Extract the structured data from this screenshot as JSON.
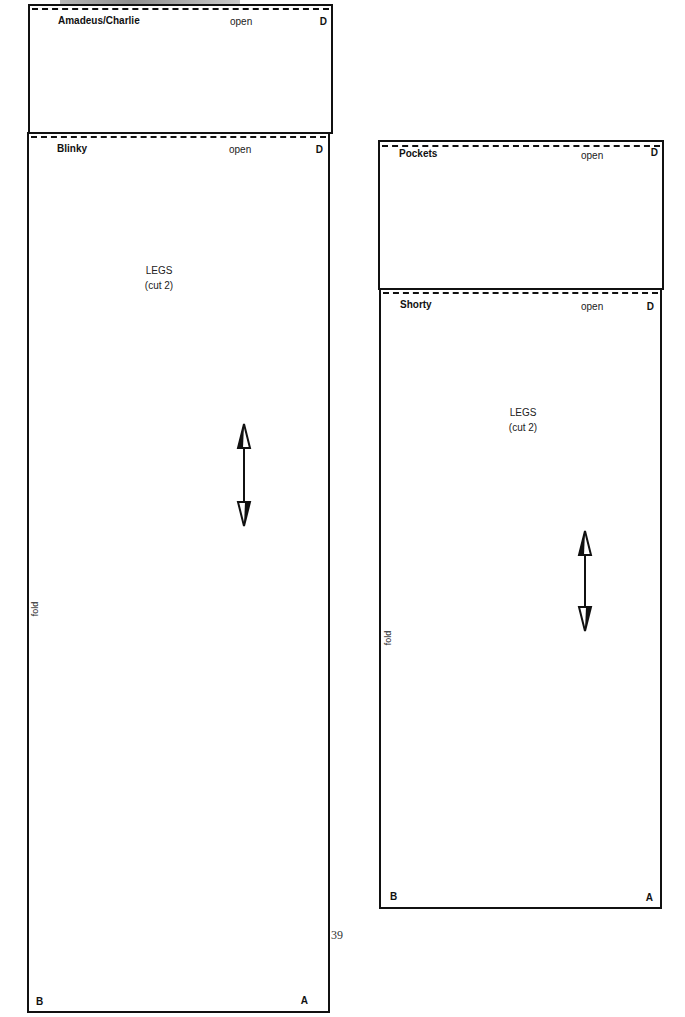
{
  "page_number": "39",
  "left_pattern": {
    "top_piece": {
      "name": "Amadeus/Charlie",
      "edge_label": "open",
      "corner": "D"
    },
    "main_piece": {
      "name": "Blinky",
      "edge_label": "open",
      "corner_top": "D",
      "title": "LEGS",
      "subtitle": "(cut 2)",
      "fold_label": "fold",
      "corner_bottom_left": "B",
      "corner_bottom_right": "A"
    }
  },
  "right_pattern": {
    "top_piece": {
      "name": "Pockets",
      "edge_label": "open",
      "corner": "D"
    },
    "main_piece": {
      "name": "Shorty",
      "edge_label": "open",
      "corner_top": "D",
      "title": "LEGS",
      "subtitle": "(cut 2)",
      "fold_label": "fold",
      "corner_bottom_left": "B",
      "corner_bottom_right": "A"
    }
  }
}
